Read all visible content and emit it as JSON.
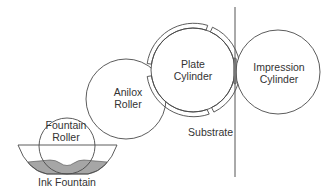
{
  "colors": {
    "line": "#4a4a4a",
    "ink": "#a6a6a6",
    "nip_ink": "#7a7a7a",
    "background": "#ffffff",
    "text": "#333333"
  },
  "components": {
    "plate_cylinder": {
      "line1": "Plate",
      "line2": "Cylinder"
    },
    "impression_cylinder": {
      "line1": "Impression",
      "line2": "Cylinder"
    },
    "anilox_roller": {
      "line1": "Anilox",
      "line2": "Roller"
    },
    "fountain_roller": {
      "line1": "Fountain",
      "line2": "Roller"
    },
    "ink_fountain": {
      "label": "Ink Fountain"
    },
    "substrate": {
      "label": "Substrate"
    }
  }
}
